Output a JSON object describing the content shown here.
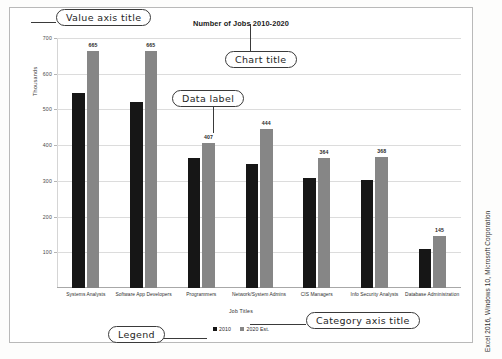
{
  "chart": {
    "title": "Number of Jobs 2010-2020",
    "value_axis_title": "Thousands",
    "category_axis_title": "Job Titles"
  },
  "legend": {
    "items": [
      {
        "label": "2010",
        "color": "#161616"
      },
      {
        "label": "2020 Est.",
        "color": "#868686"
      }
    ]
  },
  "callouts": {
    "value_axis_title": "Value axis title",
    "chart_title": "Chart title",
    "data_label": "Data label",
    "category_axis_title": "Category axis title",
    "legend": "Legend"
  },
  "credit": "Excel 2016, Windows 10, Microsoft Corporation",
  "chart_data": {
    "type": "bar",
    "title": "Number of Jobs 2010-2020",
    "xlabel": "Job Titles",
    "ylabel": "Thousands",
    "ylim": [
      0,
      700
    ],
    "yticks": [
      100,
      200,
      300,
      400,
      500,
      600,
      700
    ],
    "grid": true,
    "legend_position": "bottom",
    "categories": [
      "Systems Analysts",
      "Software App Developers",
      "Programmers",
      "Network/System Admins",
      "CIS Managers",
      "Info Security Analysts",
      "Database Administration"
    ],
    "series": [
      {
        "name": "2010",
        "color": "#161616",
        "values": [
          545,
          520,
          363,
          347,
          307,
          302,
          110
        ],
        "labels_shown": false
      },
      {
        "name": "2020 Est.",
        "color": "#868686",
        "values": [
          665,
          665,
          407,
          444,
          364,
          368,
          145
        ],
        "labels_shown": true,
        "data_labels": [
          "665",
          "665",
          "407",
          "444",
          "364",
          "368",
          "145"
        ]
      }
    ]
  }
}
